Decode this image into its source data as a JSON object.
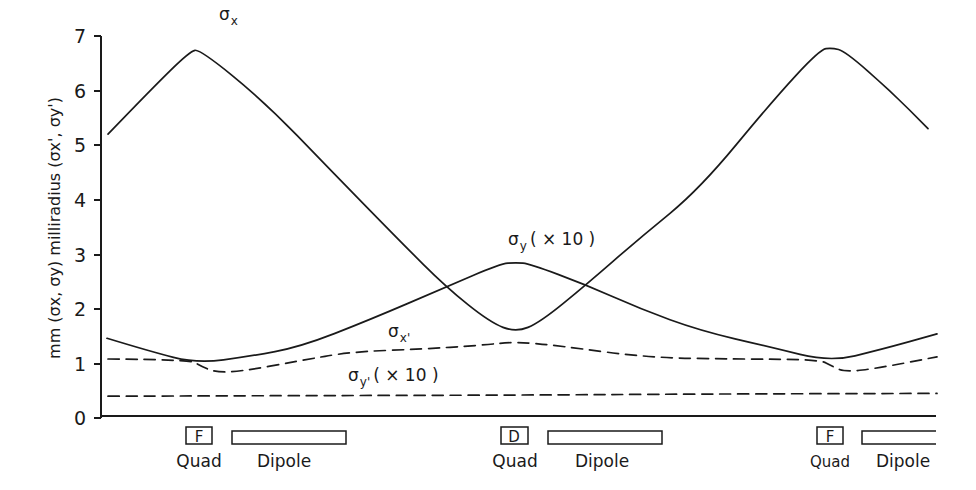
{
  "chart_data": {
    "type": "line",
    "title": "",
    "xlabel": "",
    "ylabel": "mm (σx, σy) milliradius (σx', σy')",
    "ylim": [
      0,
      7
    ],
    "yticks": [
      0,
      1,
      2,
      3,
      4,
      5,
      6,
      7
    ],
    "grid": false,
    "legend": "inline labels",
    "x_description": "position along one lattice cell (F quad – dipole – D quad – dipole – F quad – dipole)",
    "series": [
      {
        "name": "σx",
        "label": "σx",
        "style": "solid",
        "x": [
          108,
          150,
          190,
          200,
          264,
          330,
          400,
          446,
          490,
          516,
          540,
          586,
          640,
          700,
          773,
          820,
          832,
          845,
          890,
          928
        ],
        "values": [
          5.2,
          6.0,
          6.72,
          6.75,
          5.8,
          4.55,
          3.24,
          2.4,
          1.75,
          1.57,
          1.75,
          2.44,
          3.3,
          4.2,
          5.82,
          6.75,
          6.78,
          6.72,
          6.0,
          5.3
        ]
      },
      {
        "name": "σy (×10)",
        "label": "σy (×10)",
        "style": "solid",
        "x": [
          107,
          150,
          197,
          250,
          300,
          370,
          446,
          500,
          516,
          530,
          586,
          640,
          700,
          770,
          830,
          880,
          937
        ],
        "values": [
          1.46,
          1.22,
          1.0,
          1.13,
          1.3,
          1.8,
          2.4,
          2.82,
          2.85,
          2.82,
          2.44,
          2.0,
          1.6,
          1.3,
          1.03,
          1.25,
          1.54
        ]
      },
      {
        "name": "σx'",
        "label": "σx'",
        "style": "dashed",
        "x": [
          108,
          190,
          200,
          215,
          240,
          300,
          350,
          420,
          480,
          516,
          560,
          650,
          740,
          820,
          832,
          845,
          880,
          937
        ],
        "values": [
          1.08,
          1.07,
          0.96,
          0.84,
          0.85,
          1.05,
          1.21,
          1.26,
          1.33,
          1.4,
          1.32,
          1.1,
          1.08,
          1.07,
          0.95,
          0.84,
          0.92,
          1.12
        ]
      },
      {
        "name": "σy' (×10)",
        "label": "σy' (×10)",
        "style": "dashed",
        "x": [
          108,
          300,
          516,
          700,
          937
        ],
        "values": [
          0.4,
          0.41,
          0.42,
          0.44,
          0.45
        ]
      }
    ],
    "annotations": [
      {
        "text": "σx",
        "near": "left σx peak"
      },
      {
        "text": "σy (×10)",
        "near": "σy peak at D quad"
      },
      {
        "text": "σx'",
        "near": "σx' dashed curve"
      },
      {
        "text": "σy' (×10)",
        "near": "σy' dashed line"
      }
    ],
    "lattice_elements": [
      {
        "type": "Quad",
        "letter": "F",
        "x0": 186,
        "x1": 212
      },
      {
        "type": "Dipole",
        "letter": "",
        "x0": 232,
        "x1": 346
      },
      {
        "type": "Quad",
        "letter": "D",
        "x0": 501,
        "x1": 528
      },
      {
        "type": "Dipole",
        "letter": "",
        "x0": 548,
        "x1": 662
      },
      {
        "type": "Quad",
        "letter": "F",
        "x0": 817,
        "x1": 843
      },
      {
        "type": "Dipole",
        "letter": "",
        "x0": 862,
        "x1": 936
      }
    ]
  },
  "labels": {
    "sigma_x": "σ",
    "sigma_x_sub": "x",
    "sigma_y": "σ",
    "sigma_y_sub": "y",
    "sigma_y_suffix": "( × 10 )",
    "sigma_xp": "σ",
    "sigma_xp_sub": "x'",
    "sigma_yp": "σ",
    "sigma_yp_sub": "y'",
    "sigma_yp_suffix": "( × 10 )",
    "ylabel": "mm (σx, σy) milliradius (σx', σy')",
    "quad": "Quad",
    "dipole": "Dipole",
    "f": "F",
    "d": "D"
  },
  "axis": {
    "ticks": [
      "0",
      "1",
      "2",
      "3",
      "4",
      "5",
      "6",
      "7"
    ]
  }
}
